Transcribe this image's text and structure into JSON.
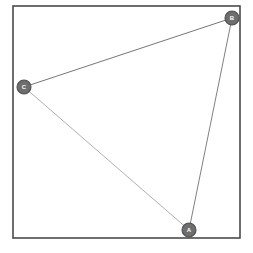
{
  "diagram": {
    "canvas": {
      "width": 253,
      "height": 253,
      "background": "#ffffff"
    },
    "frame": {
      "name": "plot-border",
      "x": 13,
      "y": 6,
      "width": 227,
      "height": 232,
      "stroke_color": "#4a4a4d",
      "fill_color": "#ffffff"
    },
    "nodes": [
      {
        "id": "A",
        "label": "A",
        "x": 189,
        "y": 230,
        "radius": 7,
        "fill_color": "#6e6e6e",
        "stroke_color": "#4d4d4d",
        "label_color": "#ffffff"
      },
      {
        "id": "B",
        "label": "B",
        "x": 232,
        "y": 18,
        "radius": 7,
        "fill_color": "#6e6e6e",
        "stroke_color": "#4d4d4d",
        "label_color": "#ffffff"
      },
      {
        "id": "C",
        "label": "C",
        "x": 24,
        "y": 87,
        "radius": 7,
        "fill_color": "#6e6e6e",
        "stroke_color": "#4d4d4d",
        "label_color": "#ffffff"
      }
    ],
    "edges": [
      {
        "id": "edge-c-b",
        "source": "C",
        "target": "B",
        "x1": 24,
        "y1": 87,
        "x2": 232,
        "y2": 18,
        "stroke_color": "#767676",
        "stroke_width": 1.0
      },
      {
        "id": "edge-c-a",
        "source": "C",
        "target": "A",
        "x1": 24,
        "y1": 87,
        "x2": 189,
        "y2": 230,
        "stroke_color": "#9a9a9a",
        "stroke_width": 0.8
      },
      {
        "id": "edge-a-b",
        "source": "A",
        "target": "B",
        "x1": 189,
        "y1": 230,
        "x2": 232,
        "y2": 18,
        "stroke_color": "#808080",
        "stroke_width": 1.0
      }
    ]
  }
}
